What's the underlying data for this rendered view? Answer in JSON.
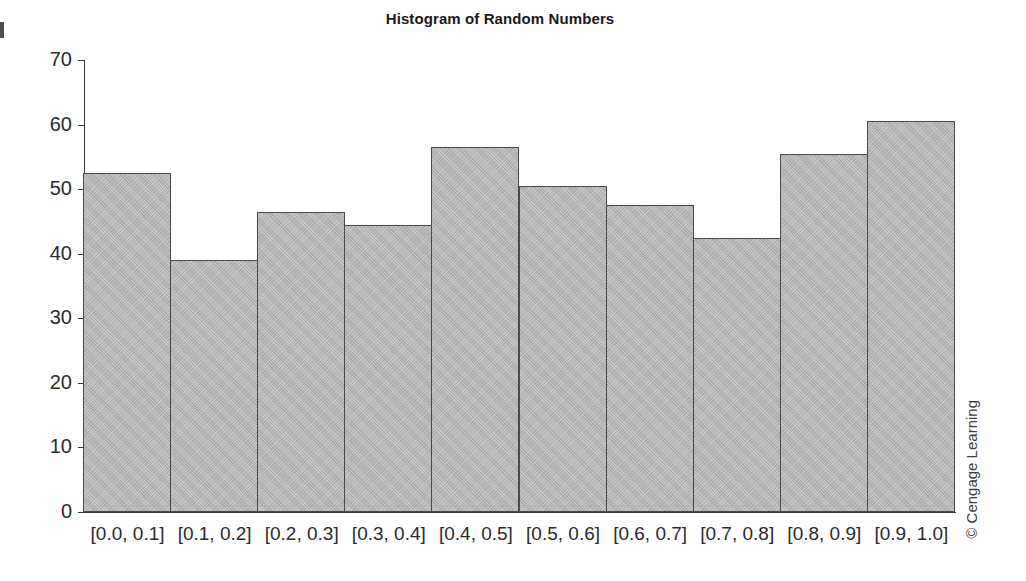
{
  "chart_data": {
    "type": "bar",
    "title": "Histogram of Random Numbers",
    "xlabel": "",
    "ylabel": "",
    "categories": [
      "[0.0, 0.1]",
      "[0.1, 0.2]",
      "[0.2, 0.3]",
      "[0.3, 0.4]",
      "[0.4, 0.5]",
      "[0.5, 0.6]",
      "[0.6, 0.7]",
      "[0.7, 0.8]",
      "[0.8, 0.9]",
      "[0.9, 1.0]"
    ],
    "values": [
      52.5,
      39,
      46.5,
      44.5,
      56.5,
      50.5,
      47.5,
      42.5,
      55.5,
      60.5
    ],
    "ylim": [
      0,
      70
    ],
    "y_ticks": [
      0,
      10,
      20,
      30,
      40,
      50,
      60,
      70
    ],
    "y_tick_labels": [
      "0",
      "10",
      "20",
      "30",
      "40",
      "50",
      "60",
      "70"
    ],
    "grid": false,
    "legend": null,
    "bar_fill_color": "#b6b6b6",
    "bar_edge_color": "#4a4a4a",
    "axis_color": "#3a3a3a"
  },
  "credit": {
    "text": "© Cengage Learning"
  }
}
